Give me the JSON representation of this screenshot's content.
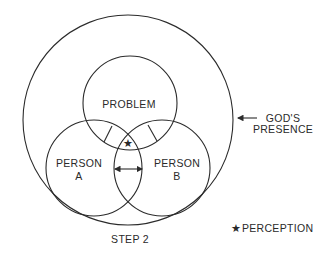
{
  "diagram": {
    "caption": "STEP 2",
    "circles": {
      "outer": {
        "label_line1": "GOD'S",
        "label_line2": "PRESENCE"
      },
      "problem": {
        "label": "PROBLEM"
      },
      "person_a": {
        "label_line1": "PERSON",
        "label_line2": "A"
      },
      "person_b": {
        "label_line1": "PERSON",
        "label_line2": "B"
      }
    },
    "legend": {
      "symbol": "★",
      "label": "PERCEPTION"
    },
    "perception_marker": "★",
    "colors": {
      "stroke": "#2b2b2b",
      "text": "#2a2a2a",
      "background": "#ffffff"
    }
  }
}
